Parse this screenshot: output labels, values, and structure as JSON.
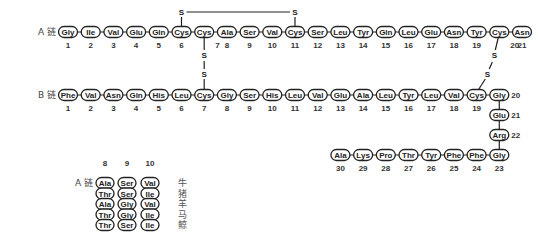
{
  "chains": {
    "a_label": "A 链",
    "b_label": "B 链",
    "a": [
      "Gly",
      "Ile",
      "Val",
      "Glu",
      "Gln",
      "Cys",
      "Cys",
      "Ala",
      "Ser",
      "Val",
      "Cys",
      "Ser",
      "Leu",
      "Tyr",
      "Gln",
      "Leu",
      "Glu",
      "Asn",
      "Tyr",
      "Cys",
      "Asn"
    ],
    "b_row": [
      "Phe",
      "Val",
      "Asn",
      "Gln",
      "His",
      "Leu",
      "Cys",
      "Gly",
      "Ser",
      "His",
      "Leu",
      "Val",
      "Glu",
      "Ala",
      "Leu",
      "Tyr",
      "Leu",
      "Val",
      "Cys",
      "Gly"
    ],
    "b_turn": [
      "Glu",
      "Arg",
      "Gly"
    ],
    "b_tail": [
      "Ala",
      "Lys",
      "Pro",
      "Thr",
      "Tyr",
      "Phe",
      "Phe"
    ],
    "b_tail_numbers": [
      "30",
      "29",
      "28",
      "27",
      "26",
      "25",
      "24"
    ]
  },
  "disulfide": {
    "s": "S",
    "bonds": [
      "A6-A11",
      "A7-B7",
      "A20-B19"
    ]
  },
  "species_table": {
    "label": "A 链",
    "positions": [
      "8",
      "9",
      "10"
    ],
    "rows": [
      {
        "residues": [
          "Ala",
          "Ser",
          "Val"
        ],
        "species": "牛"
      },
      {
        "residues": [
          "Thr",
          "Ser",
          "Ile"
        ],
        "species": "猪"
      },
      {
        "residues": [
          "Ala",
          "Gly",
          "Val"
        ],
        "species": "羊"
      },
      {
        "residues": [
          "Thr",
          "Gly",
          "Ile"
        ],
        "species": "马"
      },
      {
        "residues": [
          "Thr",
          "Ser",
          "Ile"
        ],
        "species": "鲸"
      }
    ]
  }
}
